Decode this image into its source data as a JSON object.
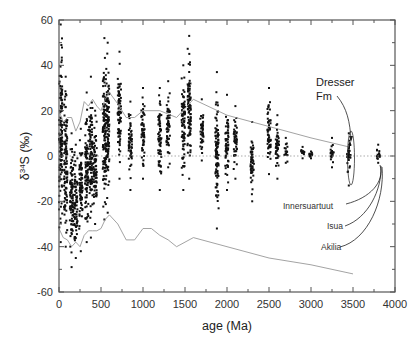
{
  "chart_data": {
    "type": "scatter",
    "title": "",
    "xlabel": "age (Ma)",
    "ylabel": "δ34S (‰)",
    "xlim": [
      0,
      4000
    ],
    "ylim": [
      -60,
      60
    ],
    "x_ticks": [
      0,
      500,
      1000,
      1500,
      2000,
      2500,
      3000,
      3500,
      4000
    ],
    "y_ticks": [
      -60,
      -40,
      -20,
      0,
      20,
      40,
      60
    ],
    "x_tick_labels": [
      "0",
      "500",
      "1000",
      "1500",
      "2000",
      "2500",
      "3000",
      "3500",
      "4000"
    ],
    "y_tick_labels": [
      "-60",
      "-40",
      "-20",
      "0",
      "20",
      "40",
      "60"
    ],
    "grid": false,
    "reference_line": {
      "y": 0,
      "style": "dotted"
    },
    "series": [
      {
        "name": "sulfide/sulfate δ34S data (point clusters)",
        "marker": "square",
        "color": "#111111",
        "clusters": [
          {
            "x": 20,
            "ymin": -38,
            "ymax": 58
          },
          {
            "x": 80,
            "ymin": -40,
            "ymax": 35
          },
          {
            "x": 150,
            "ymin": -49,
            "ymax": 10
          },
          {
            "x": 200,
            "ymin": -45,
            "ymax": 5
          },
          {
            "x": 260,
            "ymin": -42,
            "ymax": 12
          },
          {
            "x": 330,
            "ymin": -38,
            "ymax": 28
          },
          {
            "x": 380,
            "ymin": -36,
            "ymax": 35
          },
          {
            "x": 430,
            "ymin": -30,
            "ymax": 20
          },
          {
            "x": 540,
            "ymin": -28,
            "ymax": 52
          },
          {
            "x": 580,
            "ymin": -25,
            "ymax": 50
          },
          {
            "x": 720,
            "ymin": -10,
            "ymax": 46
          },
          {
            "x": 850,
            "ymin": -15,
            "ymax": 24
          },
          {
            "x": 1000,
            "ymin": -10,
            "ymax": 30
          },
          {
            "x": 1200,
            "ymin": -15,
            "ymax": 30
          },
          {
            "x": 1300,
            "ymin": -5,
            "ymax": 33
          },
          {
            "x": 1480,
            "ymin": -15,
            "ymax": 40
          },
          {
            "x": 1550,
            "ymin": -10,
            "ymax": 53
          },
          {
            "x": 1700,
            "ymin": -2,
            "ymax": 25
          },
          {
            "x": 1880,
            "ymin": -32,
            "ymax": 37
          },
          {
            "x": 2000,
            "ymin": -15,
            "ymax": 27
          },
          {
            "x": 2100,
            "ymin": -10,
            "ymax": 22
          },
          {
            "x": 2300,
            "ymin": -20,
            "ymax": 15
          },
          {
            "x": 2500,
            "ymin": -8,
            "ymax": 30
          },
          {
            "x": 2600,
            "ymin": -10,
            "ymax": 18
          },
          {
            "x": 2700,
            "ymin": -3,
            "ymax": 8
          },
          {
            "x": 2900,
            "ymin": -1,
            "ymax": 4
          },
          {
            "x": 3000,
            "ymin": -1,
            "ymax": 2
          },
          {
            "x": 3250,
            "ymin": -5,
            "ymax": 8
          },
          {
            "x": 3450,
            "ymin": -13,
            "ymax": 10
          },
          {
            "x": 3800,
            "ymin": -3,
            "ymax": 5
          }
        ]
      },
      {
        "name": "upper envelope (seawater sulfate curve)",
        "type": "line",
        "color": "#999999",
        "x": [
          0,
          50,
          100,
          150,
          200,
          250,
          300,
          350,
          400,
          450,
          500,
          550,
          600,
          700,
          800,
          900,
          1000,
          1200,
          1400,
          1600,
          2000,
          2500,
          3000,
          3450
        ],
        "y": [
          20,
          15,
          17,
          17,
          11,
          15,
          24,
          22,
          25,
          22,
          20,
          25,
          28,
          23,
          17,
          17,
          20,
          20,
          17,
          25,
          18,
          13,
          8,
          4
        ]
      },
      {
        "name": "lower envelope",
        "type": "line",
        "color": "#999999",
        "x": [
          0,
          50,
          100,
          150,
          200,
          250,
          300,
          350,
          400,
          450,
          500,
          550,
          600,
          700,
          800,
          900,
          1000,
          1100,
          1200,
          1300,
          1400,
          1600,
          2000,
          2500,
          3000,
          3500
        ],
        "y": [
          -32,
          -36,
          -37,
          -40,
          -38,
          -40,
          -35,
          -33,
          -33,
          -33,
          -32,
          -28,
          -26,
          -30,
          -37,
          -37,
          -32,
          -32,
          -35,
          -37,
          -40,
          -36,
          -40,
          -45,
          -48,
          -52
        ]
      }
    ],
    "annotations": [
      {
        "text": "Dresser",
        "x": 3450,
        "y": 20
      },
      {
        "text": "Fm",
        "x": 3450,
        "y": 15
      },
      {
        "text": "Innersuartuut",
        "x": 3100,
        "y": -22
      },
      {
        "text": "Isua",
        "x": 3250,
        "y": -29
      },
      {
        "text": "Akilia",
        "x": 3250,
        "y": -38
      }
    ]
  },
  "axes": {
    "xlabel": "age (Ma)",
    "ylabel_prefix": "δ",
    "ylabel_sup": "34",
    "ylabel_suffix": "S (‰)"
  },
  "labels": {
    "dresser": "Dresser",
    "fm": "Fm",
    "innersuartuut": "Innersuartuut",
    "isua": "Isua",
    "akilia": "Akilia"
  }
}
